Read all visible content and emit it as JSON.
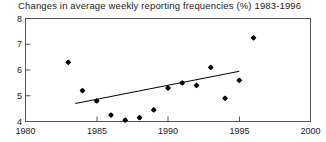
{
  "chart_data": {
    "type": "scatter",
    "title": "Changes in average weekly reporting frequencies (%) 1983-1996",
    "xlabel": "",
    "ylabel": "",
    "xlim": [
      1980,
      2000
    ],
    "ylim": [
      4,
      8
    ],
    "xticks": [
      1980,
      1985,
      1990,
      1995,
      2000
    ],
    "xticklabels": [
      "1980",
      "1985",
      "1990",
      "1995",
      "2000"
    ],
    "yticks": [
      4,
      5,
      6,
      7,
      8
    ],
    "yticklabels": [
      "4",
      "5",
      "6",
      "7",
      "8"
    ],
    "grid": false,
    "legend": false,
    "marker": "filled-diamond",
    "marker_color": "#000000",
    "x": [
      1983,
      1984,
      1985,
      1986,
      1987,
      1988,
      1989,
      1990,
      1991,
      1992,
      1993,
      1994,
      1995,
      1996
    ],
    "values": [
      6.3,
      5.2,
      4.8,
      4.25,
      4.05,
      4.15,
      4.45,
      5.3,
      5.5,
      5.4,
      6.1,
      4.9,
      5.6,
      7.25
    ],
    "series": [
      {
        "name": "Average weekly reporting frequency change",
        "x": [
          1983,
          1984,
          1985,
          1986,
          1987,
          1988,
          1989,
          1990,
          1991,
          1992,
          1993,
          1994,
          1995,
          1996
        ],
        "values": [
          6.3,
          5.2,
          4.8,
          4.25,
          4.05,
          4.15,
          4.45,
          5.3,
          5.5,
          5.4,
          6.1,
          4.9,
          5.6,
          7.25
        ]
      }
    ],
    "trendline": {
      "type": "linear-fit",
      "color": "#000000",
      "x_start": 1983.5,
      "y_start": 4.7,
      "x_end": 1995.0,
      "y_end": 5.95
    }
  }
}
